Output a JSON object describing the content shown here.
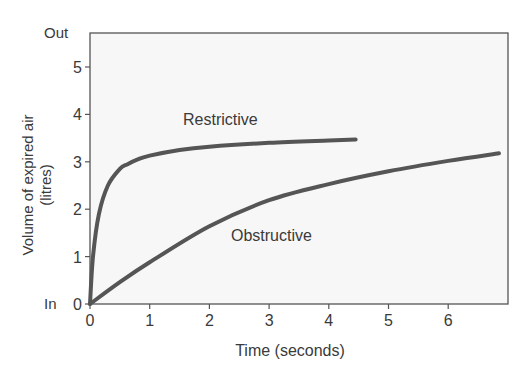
{
  "chart_data": {
    "type": "line",
    "title": "",
    "xlabel": "Time (seconds)",
    "ylabel": "Volume of expired air (litres)",
    "ylabel_line1": "Volume of expired air",
    "ylabel_line2": "(litres)",
    "xlim": [
      0,
      7
    ],
    "ylim": [
      0,
      5.6
    ],
    "x_ticks": [
      "0",
      "1",
      "2",
      "3",
      "4",
      "5",
      "6"
    ],
    "y_ticks": [
      "0",
      "1",
      "2",
      "3",
      "4",
      "5"
    ],
    "y_annotations": {
      "top": "Out",
      "bottom": "In"
    },
    "grid": false,
    "legend": "inline labels",
    "series": [
      {
        "name": "Restrictive",
        "x": [
          0,
          0.05,
          0.15,
          0.3,
          0.5,
          0.63,
          0.8,
          1.0,
          1.5,
          2.0,
          3.0,
          4.0,
          4.45
        ],
        "values": [
          0,
          1.0,
          1.9,
          2.5,
          2.85,
          2.95,
          3.05,
          3.13,
          3.25,
          3.32,
          3.4,
          3.45,
          3.47
        ]
      },
      {
        "name": "Obstructive",
        "x": [
          0,
          0.5,
          1,
          2,
          3,
          4,
          5,
          6,
          6.85
        ],
        "values": [
          0,
          0.46,
          0.88,
          1.64,
          2.19,
          2.53,
          2.8,
          3.02,
          3.18
        ]
      }
    ],
    "annotations": [
      {
        "text": "Restrictive",
        "x": 1.6,
        "y": 3.85
      },
      {
        "text": "Obstructive",
        "x": 2.4,
        "y": 1.4
      }
    ]
  }
}
